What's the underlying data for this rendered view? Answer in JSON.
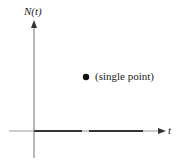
{
  "diagram": {
    "y_axis_label": "N(t)",
    "x_axis_label": "t",
    "annotation": "(single point)",
    "point": {
      "x": 86,
      "y": 77
    },
    "colors": {
      "axis": "#8a8a8a",
      "thick_segment": "#333333",
      "point": "#111111"
    }
  }
}
